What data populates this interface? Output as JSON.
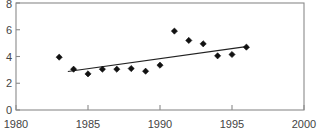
{
  "chart_data": {
    "type": "scatter",
    "title": "",
    "subtitle": "",
    "xlabel": "",
    "ylabel": "",
    "xlim": [
      1980,
      2000
    ],
    "ylim": [
      0,
      8
    ],
    "grid": false,
    "legend": null,
    "x_ticks": [
      1980,
      1985,
      1990,
      1995,
      2000
    ],
    "x_tick_labels": [
      "1980",
      "1985",
      "1990",
      "1995",
      "2000"
    ],
    "y_ticks": [
      0,
      2,
      4,
      6,
      8
    ],
    "y_tick_labels": [
      "0",
      "2",
      "4",
      "6",
      "8"
    ],
    "series": [
      {
        "name": "observations",
        "marker": "diamond",
        "color": "#111111",
        "x": [
          1983,
          1984,
          1985,
          1986,
          1987,
          1988,
          1989,
          1990,
          1991,
          1992,
          1993,
          1994,
          1995,
          1996
        ],
        "values": [
          3.95,
          3.05,
          2.7,
          3.05,
          3.05,
          3.1,
          2.9,
          3.35,
          5.9,
          5.2,
          4.95,
          4.05,
          4.15,
          4.7
        ]
      },
      {
        "name": "trend-line",
        "marker": "none",
        "color": "#222222",
        "x": [
          1983.6,
          1996.1
        ],
        "values": [
          2.88,
          4.75
        ]
      }
    ]
  },
  "axes": {
    "x_tick_labels": [
      "1980",
      "1985",
      "1990",
      "1995",
      "2000"
    ],
    "y_tick_labels": [
      "0",
      "2",
      "4",
      "6",
      "8"
    ]
  }
}
